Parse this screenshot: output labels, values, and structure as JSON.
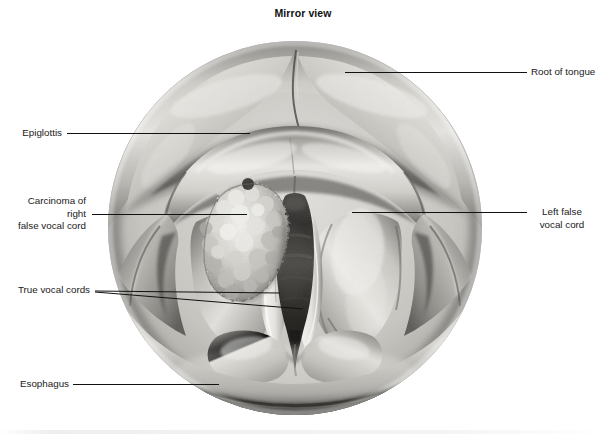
{
  "figure": {
    "title": "Mirror view",
    "view_shape": "circle",
    "circle": {
      "cx": 295,
      "cy": 228,
      "r": 187
    }
  },
  "colors": {
    "background": "#ffffff",
    "text": "#1a1a1a",
    "leader_line": "#111111",
    "tissue_light": "#d8d6d2",
    "tissue_mid": "#a8a6a2",
    "tissue_dark": "#6e6c69",
    "tissue_shadow": "#454442",
    "glottis_dark": "#2b2a28",
    "vocal_cord_pale": "#efeeea",
    "tumor_light": "#e9e8e4",
    "tumor_shadow": "#8a8884"
  },
  "labels": [
    {
      "id": "root-of-tongue",
      "text": "Root of tongue",
      "side": "right",
      "align": "left",
      "text_x": 531,
      "text_y": 66,
      "leader": {
        "x1": 345,
        "y1": 72,
        "x2": 527,
        "y2": 72
      }
    },
    {
      "id": "epiglottis",
      "text": "Epiglottis",
      "side": "left",
      "align": "right",
      "text_x": 14,
      "text_y": 127,
      "text_w": 48,
      "leader": {
        "x1": 250,
        "y1": 133,
        "x2": 67,
        "y2": 133
      }
    },
    {
      "id": "carcinoma-of-right-false-vocal-cord",
      "text": "Carcinoma of right\nfalse vocal cord",
      "side": "left",
      "align": "right",
      "text_x": 14,
      "text_y": 195,
      "text_w": 72,
      "leader": {
        "x1": 247,
        "y1": 214,
        "x2": 92,
        "y2": 214
      }
    },
    {
      "id": "left-false-vocal-cord",
      "text": "Left false\nvocal cord",
      "side": "right",
      "align": "center",
      "text_x": 531,
      "text_y": 206,
      "leader": {
        "x1": 352,
        "y1": 212,
        "x2": 527,
        "y2": 212
      }
    },
    {
      "id": "true-vocal-cords",
      "text": "True vocal cords",
      "side": "left",
      "align": "right",
      "text_x": 14,
      "text_y": 284,
      "text_w": 76,
      "leaders": [
        {
          "x1": 280,
          "y1": 293,
          "x2": 95,
          "y2": 291
        },
        {
          "x1": 302,
          "y1": 308,
          "x2": 95,
          "y2": 292
        }
      ]
    },
    {
      "id": "esophagus",
      "text": "Esophagus",
      "side": "left",
      "align": "right",
      "text_x": 14,
      "text_y": 378,
      "text_w": 55,
      "leader": {
        "x1": 219,
        "y1": 384,
        "x2": 73,
        "y2": 384
      }
    }
  ],
  "anatomy_parts": [
    {
      "id": "root-of-tongue",
      "name": "Root of tongue",
      "region": "superior"
    },
    {
      "id": "epiglottis",
      "name": "Epiglottis",
      "region": "upper-central"
    },
    {
      "id": "false-vocal-cords",
      "name": "False vocal cords (ventricular folds)",
      "region": "mid"
    },
    {
      "id": "true-vocal-cords",
      "name": "True vocal cords",
      "region": "central-glottis"
    },
    {
      "id": "glottis",
      "name": "Glottic airway (rima glottidis)",
      "region": "central"
    },
    {
      "id": "pyriform-sinus",
      "name": "Pyriform sinuses",
      "region": "lateral"
    },
    {
      "id": "esophagus",
      "name": "Esophagus (postcricoid inlet)",
      "region": "inferior"
    },
    {
      "id": "tumor",
      "name": "Carcinoma, right false vocal cord",
      "region": "left-of-midline-in-image"
    }
  ]
}
